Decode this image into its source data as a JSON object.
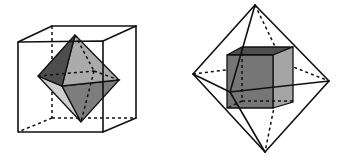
{
  "figure": {
    "colors": {
      "background": "#ffffff",
      "line": "#111111",
      "face_dark": "#4a4a4a",
      "face_medium": "#7a7a7a",
      "face_light": "#a9a9a9",
      "face_lightest": "#cfcfcf"
    },
    "panels": [
      {
        "name": "octahedron-in-cube",
        "outer_solid": "cube",
        "inner_solid": "octahedron"
      },
      {
        "name": "cube-in-octahedron",
        "outer_solid": "octahedron",
        "inner_solid": "cube"
      }
    ]
  }
}
